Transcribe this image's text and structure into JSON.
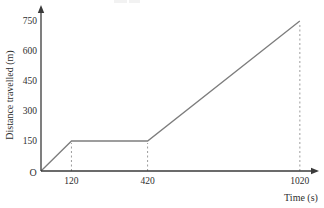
{
  "chart_data": {
    "type": "line",
    "title": "",
    "xlabel": "Time (s)",
    "ylabel": "Distance travelled (m)",
    "origin_label": "O",
    "x_ticks": [
      120,
      420,
      1020
    ],
    "y_ticks": [
      150,
      300,
      450,
      600,
      750
    ],
    "xlim": [
      0,
      1060
    ],
    "ylim": [
      0,
      785
    ],
    "grid": false,
    "legend": false,
    "series": [
      {
        "name": "distance-time",
        "points": [
          [
            0,
            0
          ],
          [
            120,
            150
          ],
          [
            420,
            150
          ],
          [
            1020,
            750
          ]
        ]
      }
    ],
    "dashed_guides": [
      {
        "x": 120,
        "y": 150
      },
      {
        "x": 420,
        "y": 150
      },
      {
        "x": 1020,
        "y": 750
      }
    ],
    "colors": {
      "line": "#7d7d7d",
      "axis": "#3a3a3a",
      "guide": "#9c9c9c",
      "text": "#2e2e2e"
    }
  }
}
